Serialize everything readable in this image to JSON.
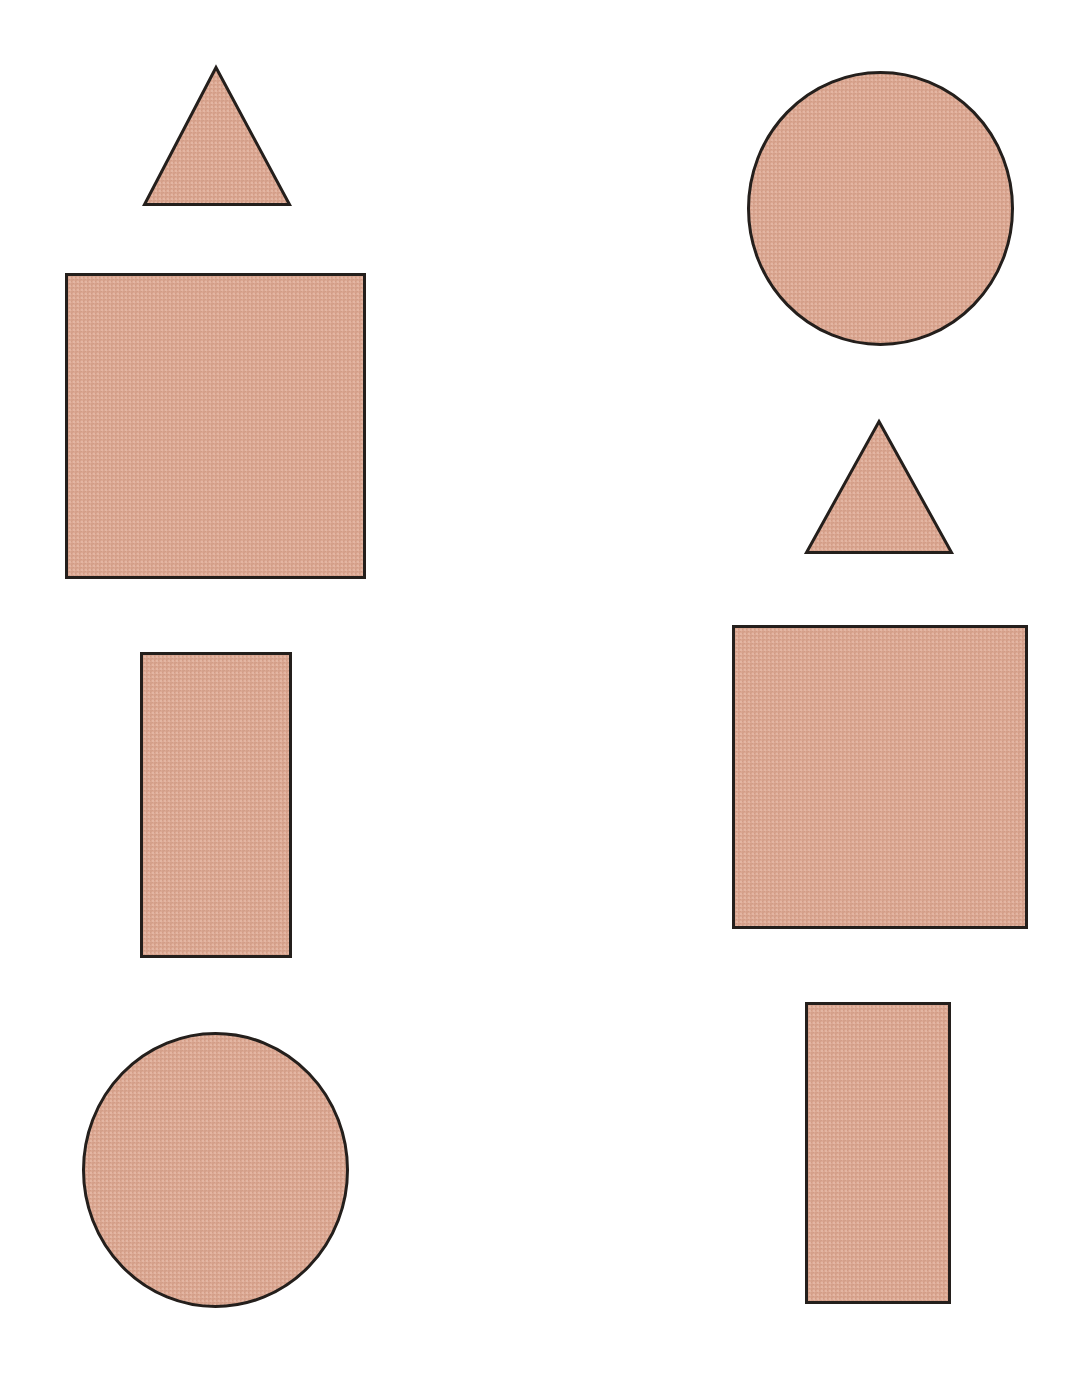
{
  "figure": {
    "width": 1075,
    "height": 1380,
    "background_color": "#FFFFFF",
    "columns": [
      {
        "name": "left-column",
        "label": "Left column"
      },
      {
        "name": "right-column",
        "label": "Right column"
      }
    ]
  },
  "style": {
    "fill_color": "#DCA893",
    "fill_color_light": "#E3B6A3",
    "fill_color_dark": "#D29C86",
    "stroke_color": "#241F1C",
    "stroke_width": 3,
    "texture": "halftone-weave"
  },
  "shapes": [
    {
      "id": "left-triangle",
      "name": "triangle",
      "label": "Triangle",
      "column": "left",
      "order": 1,
      "x": 143,
      "y": 66,
      "width": 148,
      "height": 140,
      "apex_x": 216,
      "fill": "#DCA893",
      "stroke": "#241F1C"
    },
    {
      "id": "left-square",
      "name": "square",
      "label": "Square",
      "column": "left",
      "order": 2,
      "x": 65,
      "y": 273,
      "width": 301,
      "height": 306,
      "fill": "#DCA893",
      "stroke": "#241F1C"
    },
    {
      "id": "left-rectangle",
      "name": "rectangle",
      "label": "Rectangle",
      "column": "left",
      "order": 3,
      "x": 140,
      "y": 652,
      "width": 152,
      "height": 306,
      "fill": "#DCA893",
      "stroke": "#241F1C"
    },
    {
      "id": "left-circle",
      "name": "circle",
      "label": "Circle",
      "column": "left",
      "order": 4,
      "x": 82,
      "y": 1032,
      "width": 267,
      "height": 276,
      "fill": "#DCA893",
      "stroke": "#241F1C"
    },
    {
      "id": "right-circle",
      "name": "circle",
      "label": "Circle",
      "column": "right",
      "order": 1,
      "x": 747,
      "y": 71,
      "width": 267,
      "height": 275,
      "fill": "#DCA893",
      "stroke": "#241F1C"
    },
    {
      "id": "right-triangle",
      "name": "triangle",
      "label": "Triangle",
      "column": "right",
      "order": 2,
      "x": 805,
      "y": 420,
      "width": 148,
      "height": 134,
      "apex_x": 879,
      "fill": "#DCA893",
      "stroke": "#241F1C"
    },
    {
      "id": "right-square",
      "name": "square",
      "label": "Square",
      "column": "right",
      "order": 3,
      "x": 732,
      "y": 625,
      "width": 296,
      "height": 304,
      "fill": "#DCA893",
      "stroke": "#241F1C"
    },
    {
      "id": "right-rectangle",
      "name": "rectangle",
      "label": "Rectangle",
      "column": "right",
      "order": 4,
      "x": 805,
      "y": 1002,
      "width": 146,
      "height": 302,
      "fill": "#DCA893",
      "stroke": "#241F1C"
    }
  ]
}
